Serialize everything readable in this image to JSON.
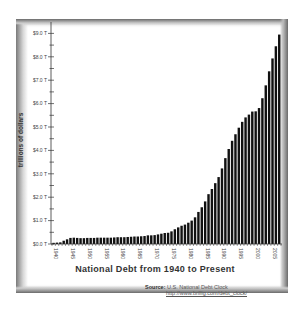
{
  "chart_data": {
    "type": "bar",
    "title": "National Debt from 1940 to Present",
    "xlabel": "",
    "ylabel": "trillions of dollars",
    "ylim": [
      0,
      9.0
    ],
    "yticks": [
      "$0.0 T",
      "$1.0 T",
      "$2.0 T",
      "$3.0 T",
      "$4.0 T",
      "$5.0 T",
      "$6.0 T",
      "$7.0 T",
      "$8.0 T",
      "$9.0 T"
    ],
    "xticks": [
      "1940",
      "1945",
      "1950",
      "1955",
      "1960",
      "1965",
      "1970",
      "1975",
      "1980",
      "1985",
      "1990",
      "1995",
      "2000",
      "2005"
    ],
    "grid": false,
    "legend": null,
    "bar_color": "#111111",
    "categories": [
      1940,
      1941,
      1942,
      1943,
      1944,
      1945,
      1946,
      1947,
      1948,
      1949,
      1950,
      1951,
      1952,
      1953,
      1954,
      1955,
      1956,
      1957,
      1958,
      1959,
      1960,
      1961,
      1962,
      1963,
      1964,
      1965,
      1966,
      1967,
      1968,
      1969,
      1970,
      1971,
      1972,
      1973,
      1974,
      1975,
      1976,
      1977,
      1978,
      1979,
      1980,
      1981,
      1982,
      1983,
      1984,
      1985,
      1986,
      1987,
      1988,
      1989,
      1990,
      1991,
      1992,
      1993,
      1994,
      1995,
      1996,
      1997,
      1998,
      1999,
      2000,
      2001,
      2002,
      2003,
      2004,
      2005,
      2006,
      2007
    ],
    "values": [
      0.05,
      0.06,
      0.07,
      0.14,
      0.2,
      0.26,
      0.27,
      0.26,
      0.25,
      0.25,
      0.26,
      0.26,
      0.26,
      0.27,
      0.27,
      0.27,
      0.27,
      0.27,
      0.28,
      0.29,
      0.29,
      0.29,
      0.3,
      0.31,
      0.32,
      0.32,
      0.33,
      0.34,
      0.37,
      0.37,
      0.38,
      0.41,
      0.44,
      0.47,
      0.48,
      0.54,
      0.63,
      0.71,
      0.78,
      0.83,
      0.91,
      1.0,
      1.14,
      1.37,
      1.57,
      1.82,
      2.13,
      2.35,
      2.6,
      2.86,
      3.23,
      3.67,
      4.06,
      4.41,
      4.69,
      4.97,
      5.22,
      5.41,
      5.53,
      5.66,
      5.67,
      5.81,
      6.23,
      6.78,
      7.38,
      7.93,
      8.45,
      8.95
    ]
  },
  "source": {
    "label": "Source:",
    "text": "U.S. National Debt Clock",
    "url": "http://www.brillig.com/debt_clock/"
  }
}
